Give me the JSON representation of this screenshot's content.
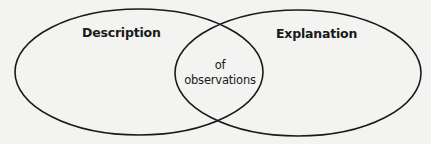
{
  "diagram": {
    "type": "venn",
    "sets": [
      {
        "id": "left",
        "label": "Description"
      },
      {
        "id": "right",
        "label": "Explanation"
      }
    ],
    "intersection": {
      "lines": [
        "of",
        "observations"
      ]
    },
    "colors": {
      "stroke": "#1a1a1a",
      "background": "#f3f3f1",
      "text": "#1a1a1a"
    }
  }
}
